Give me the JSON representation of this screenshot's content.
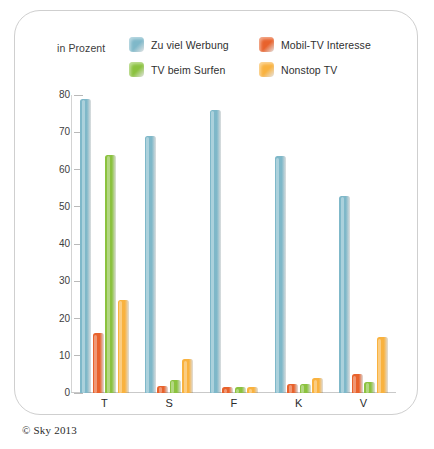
{
  "axis_note": "in Prozent",
  "credit": "© Sky 2013",
  "legend": [
    {
      "label": "Zu viel Werbung",
      "color": "#7fb8c9"
    },
    {
      "label": "Mobil-TV Interesse",
      "color": "#e8622c"
    },
    {
      "label": "TV beim Surfen",
      "color": "#8bc23f"
    },
    {
      "label": "Nonstop TV",
      "color": "#f9b23f"
    }
  ],
  "chart_data": {
    "type": "bar",
    "title": "",
    "subtitle": "",
    "xlabel": "",
    "ylabel": "in Prozent",
    "ylim": [
      0,
      80
    ],
    "yticks": [
      0,
      10,
      20,
      30,
      40,
      50,
      60,
      70,
      80
    ],
    "grid": false,
    "legend_position": "top",
    "categories": [
      "T",
      "S",
      "F",
      "K",
      "V"
    ],
    "series": [
      {
        "name": "Zu viel Werbung",
        "color": "#7fb8c9",
        "values": [
          79,
          69,
          76,
          63.5,
          53
        ]
      },
      {
        "name": "Mobil-TV Interesse",
        "color": "#e8622c",
        "values": [
          16,
          2,
          1.5,
          2.5,
          5
        ]
      },
      {
        "name": "TV beim Surfen",
        "color": "#8bc23f",
        "values": [
          64,
          3.5,
          1.5,
          2.5,
          3
        ]
      },
      {
        "name": "Nonstop TV",
        "color": "#f9b23f",
        "values": [
          25,
          9,
          1.5,
          4,
          15
        ]
      }
    ]
  }
}
